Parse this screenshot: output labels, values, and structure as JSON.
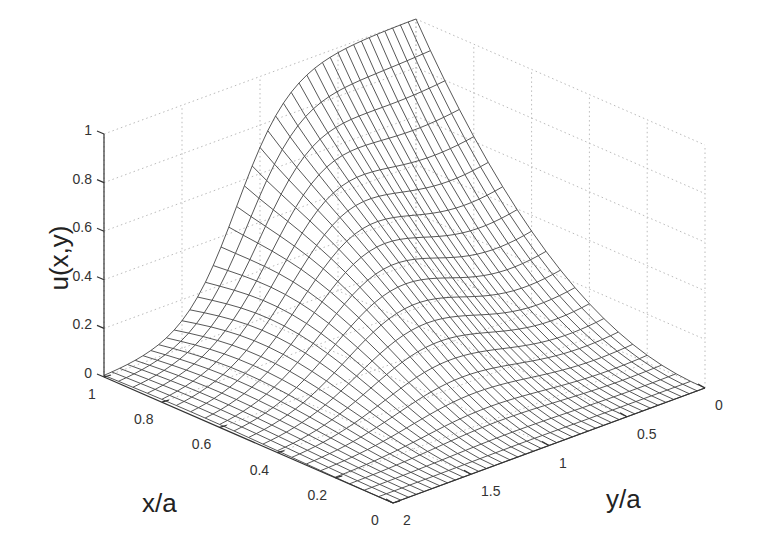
{
  "chart_data": {
    "type": "surface3d",
    "title": "",
    "xlabel": "x/a",
    "ylabel": "y/a",
    "zlabel": "u(x,y)",
    "xlim": [
      0,
      1
    ],
    "ylim": [
      0,
      2
    ],
    "zlim": [
      0,
      1
    ],
    "x_ticks": [
      "0",
      "0.2",
      "0.4",
      "0.6",
      "0.8",
      "1"
    ],
    "y_ticks": [
      "0",
      "0.5",
      "1",
      "1.5",
      "2"
    ],
    "z_ticks": [
      "0",
      "0.2",
      "0.4",
      "0.6",
      "0.8",
      "1"
    ],
    "grid": true,
    "mesh": {
      "nx": 21,
      "ny": 41
    },
    "edge_samples": {
      "x_eq_1": {
        "y": [
          0,
          0.25,
          0.5,
          0.75,
          0.9,
          1.0,
          1.25,
          1.5,
          1.75,
          2.0
        ],
        "u": [
          1.0,
          1.0,
          1.0,
          0.98,
          0.92,
          0.8,
          0.45,
          0.2,
          0.06,
          0.0
        ]
      },
      "y_eq_0": {
        "x": [
          0,
          0.2,
          0.4,
          0.6,
          0.8,
          0.9,
          1.0
        ],
        "u": [
          0.0,
          0.02,
          0.08,
          0.2,
          0.45,
          0.7,
          1.0
        ]
      }
    }
  },
  "colors": {
    "mesh_line": "#444444",
    "grid": "#bbbbbb",
    "axis": "#333333",
    "background": "#ffffff"
  }
}
